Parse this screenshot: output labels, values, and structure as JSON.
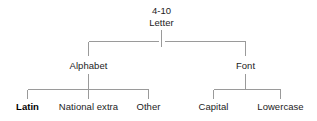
{
  "diagram": {
    "type": "hierarchy-tree",
    "title": "",
    "background_color": "#ffffff",
    "line_color": "#9a9a9a",
    "text_color": "#1c1c1c",
    "root": {
      "number": "4-10",
      "label": "Letter"
    },
    "level2": [
      {
        "label": "Alphabet"
      },
      {
        "label": "Font"
      }
    ],
    "leaves_left": [
      {
        "label": "Latin",
        "emphasis": "bold"
      },
      {
        "label": "National extra",
        "emphasis": "normal"
      },
      {
        "label": "Other",
        "emphasis": "normal"
      }
    ],
    "leaves_right": [
      {
        "label": "Capital",
        "emphasis": "normal"
      },
      {
        "label": "Lowercase",
        "emphasis": "normal"
      }
    ]
  }
}
